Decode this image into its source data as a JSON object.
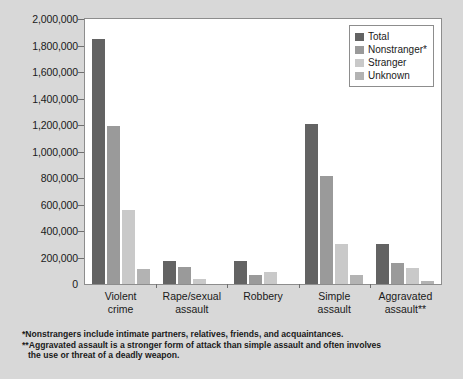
{
  "chart_data": {
    "type": "bar",
    "title": "",
    "subtitle": "",
    "xlabel": "",
    "ylabel": "",
    "ylim": [
      0,
      2000000
    ],
    "grid": false,
    "legend_position": "top-right",
    "categories": [
      "Violent crime",
      "Rape/sexual assault",
      "Robbery",
      "Simple assault",
      "Aggravated assault**"
    ],
    "category_lines": [
      [
        "Violent",
        "crime"
      ],
      [
        "Rape/sexual",
        "assault"
      ],
      [
        "Robbery",
        ""
      ],
      [
        "Simple",
        "assault"
      ],
      [
        "Aggravated",
        "assault**"
      ]
    ],
    "y_ticks": [
      0,
      200000,
      400000,
      600000,
      800000,
      1000000,
      1200000,
      1400000,
      1600000,
      1800000,
      2000000
    ],
    "y_tick_labels": [
      "0",
      "200,000",
      "400,000",
      "600,000",
      "800,000",
      "1,000,000",
      "1,200,000",
      "1,400,000",
      "1,600,000",
      "1,800,000",
      "2,000,000"
    ],
    "series": [
      {
        "name": "Total",
        "color": "#636363",
        "values": [
          1850000,
          175000,
          170000,
          1205000,
          300000
        ]
      },
      {
        "name": "Nonstranger*",
        "color": "#9a9a9a",
        "values": [
          1190000,
          125000,
          70000,
          815000,
          160000
        ]
      },
      {
        "name": "Stranger",
        "color": "#c9c9c9",
        "values": [
          560000,
          40000,
          90000,
          300000,
          120000
        ]
      },
      {
        "name": "Unknown",
        "color": "#b3b3b3",
        "values": [
          110000,
          0,
          0,
          70000,
          20000
        ]
      }
    ]
  },
  "legend": {
    "items": [
      {
        "label": "Total",
        "color": "#636363"
      },
      {
        "label": "Nonstranger*",
        "color": "#9a9a9a"
      },
      {
        "label": "Stranger",
        "color": "#c9c9c9"
      },
      {
        "label": "Unknown",
        "color": "#b3b3b3"
      }
    ]
  },
  "footnotes": [
    {
      "text": "*Nonstrangers include intimate partners, relatives, friends, and acquaintances.",
      "continuation": ""
    },
    {
      "text": "**Aggravated assault is a stronger form of attack than simple assault and often involves",
      "continuation": "the use or threat of a deadly weapon."
    }
  ],
  "colors": {
    "figure_background": "#d8d8d8",
    "plot_background": "#ffffff",
    "axis": "#8d8d8d",
    "text": "#1a1a1a"
  }
}
